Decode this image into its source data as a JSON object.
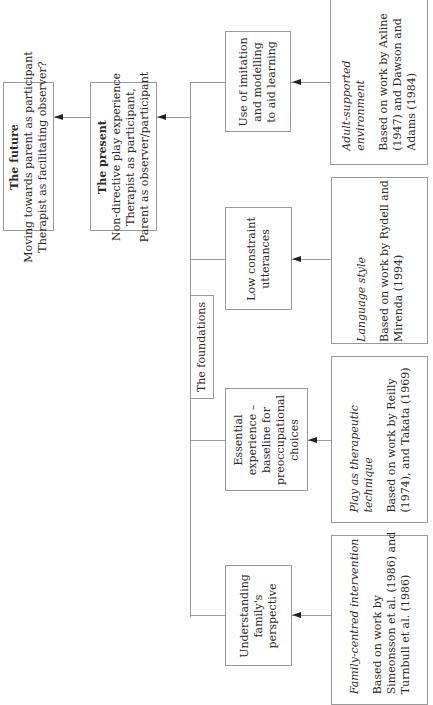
{
  "diagram": {
    "future": {
      "title": "The future",
      "lines": [
        "Moving towards parent as participant",
        "Therapist as facilitating observer?"
      ]
    },
    "present": {
      "title": "The present",
      "lines": [
        "Non-directive play experience",
        "Therapist as participant,",
        "Parent as observer/participant"
      ]
    },
    "foundations": {
      "label": "The foundations"
    },
    "components": [
      {
        "lines": [
          "Use of imitation",
          "and modelling",
          "to aid learning"
        ],
        "source": {
          "title_lines": [
            "Adult-supported",
            "environment"
          ],
          "body_lines": [
            "Based on work by Axline",
            "(1947) and Dawson and",
            "Adams (1984)"
          ]
        }
      },
      {
        "lines": [
          "Low constraint",
          "utterances"
        ],
        "source": {
          "title_lines": [
            "Language style"
          ],
          "body_lines": [
            "Based on work by Rydell and",
            "Mirenda (1994)"
          ]
        }
      },
      {
        "lines": [
          "Essential",
          "experience –",
          "baseline for",
          "preoccupational",
          "choices"
        ],
        "source": {
          "title_lines": [
            "Play as therapeutic",
            "technique"
          ],
          "body_lines": [
            "Based on work by Reilly",
            "(1974), and Takata (1969)"
          ]
        }
      },
      {
        "lines": [
          "Understanding",
          "family's",
          "perspective"
        ],
        "source": {
          "title_lines": [
            "Family-centred intervention"
          ],
          "body_lines": [
            "Based on work by",
            "Simeonsson et al. (1986) and",
            "Turnbull et al. (1986)"
          ]
        }
      }
    ],
    "colors": {
      "line": "#9a9a9a",
      "arrow": "#222222",
      "text": "#2b2b2b",
      "background": "#ffffff"
    }
  }
}
